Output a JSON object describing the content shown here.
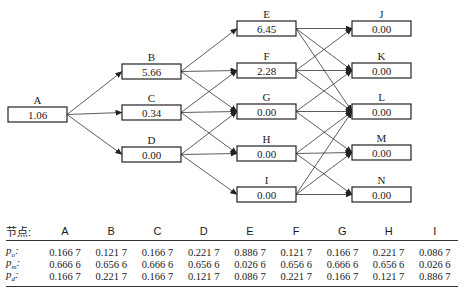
{
  "diagram": {
    "nodes": [
      {
        "id": "A",
        "label": "A",
        "value": "1.06",
        "x": 8,
        "y": 107
      },
      {
        "id": "B",
        "label": "B",
        "value": "5.66",
        "x": 122,
        "y": 64
      },
      {
        "id": "C",
        "label": "C",
        "value": "0.34",
        "x": 122,
        "y": 105
      },
      {
        "id": "D",
        "label": "D",
        "value": "0.00",
        "x": 122,
        "y": 147
      },
      {
        "id": "E",
        "label": "E",
        "value": "6.45",
        "x": 237,
        "y": 21
      },
      {
        "id": "F",
        "label": "F",
        "value": "2.28",
        "x": 237,
        "y": 63
      },
      {
        "id": "G",
        "label": "G",
        "value": "0.00",
        "x": 237,
        "y": 104
      },
      {
        "id": "H",
        "label": "H",
        "value": "0.00",
        "x": 237,
        "y": 146
      },
      {
        "id": "I",
        "label": "I",
        "value": "0.00",
        "x": 237,
        "y": 187
      },
      {
        "id": "J",
        "label": "J",
        "value": "0.00",
        "x": 352,
        "y": 21
      },
      {
        "id": "K",
        "label": "K",
        "value": "0.00",
        "x": 352,
        "y": 63
      },
      {
        "id": "L",
        "label": "L",
        "value": "0.00",
        "x": 352,
        "y": 104
      },
      {
        "id": "M",
        "label": "M",
        "value": "0.00",
        "x": 352,
        "y": 145
      },
      {
        "id": "N",
        "label": "N",
        "value": "0.00",
        "x": 352,
        "y": 187
      }
    ],
    "edges": [
      [
        "A",
        "B"
      ],
      [
        "A",
        "C"
      ],
      [
        "A",
        "D"
      ],
      [
        "B",
        "E"
      ],
      [
        "B",
        "F"
      ],
      [
        "B",
        "G"
      ],
      [
        "C",
        "F"
      ],
      [
        "C",
        "G"
      ],
      [
        "C",
        "H"
      ],
      [
        "D",
        "G"
      ],
      [
        "D",
        "H"
      ],
      [
        "D",
        "I"
      ],
      [
        "E",
        "J"
      ],
      [
        "E",
        "K"
      ],
      [
        "E",
        "L"
      ],
      [
        "F",
        "J"
      ],
      [
        "F",
        "K"
      ],
      [
        "F",
        "L"
      ],
      [
        "G",
        "K"
      ],
      [
        "G",
        "L"
      ],
      [
        "G",
        "M"
      ],
      [
        "H",
        "L"
      ],
      [
        "H",
        "M"
      ],
      [
        "H",
        "N"
      ],
      [
        "I",
        "L"
      ],
      [
        "I",
        "M"
      ],
      [
        "I",
        "N"
      ]
    ]
  },
  "table": {
    "header_label": "节点:",
    "columns": [
      "A",
      "B",
      "C",
      "D",
      "E",
      "F",
      "G",
      "H",
      "I"
    ],
    "rows": [
      {
        "label": "p_u:",
        "label_main": "p",
        "label_sub": "u",
        "values": [
          "0.166 7",
          "0.121 7",
          "0.166 7",
          "0.221 7",
          "0.886 7",
          "0.121 7",
          "0.166 7",
          "0.221 7",
          "0.086 7"
        ]
      },
      {
        "label": "p_m:",
        "label_main": "p",
        "label_sub": "m",
        "values": [
          "0.666 6",
          "0.656 6",
          "0.666 6",
          "0.656 6",
          "0.026 6",
          "0.656 6",
          "0.666 6",
          "0.656 6",
          "0.026 6"
        ]
      },
      {
        "label": "p_d:",
        "label_main": "p",
        "label_sub": "d",
        "values": [
          "0.166 7",
          "0.221 7",
          "0.166 7",
          "0.121 7",
          "0.086 7",
          "0.221 7",
          "0.166 7",
          "0.121 7",
          "0.886 7"
        ]
      }
    ]
  }
}
